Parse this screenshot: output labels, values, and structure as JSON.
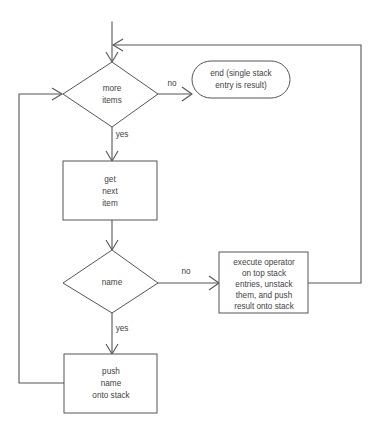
{
  "diagram": {
    "type": "flowchart",
    "background_color": "#ffffff",
    "line_color": "#555555",
    "text_color": "#3f3f3f",
    "nodes": [
      {
        "id": "start-entry",
        "shape": "entry-arrow",
        "label": ""
      },
      {
        "id": "more-items",
        "shape": "diamond",
        "lines": [
          "more",
          "items"
        ],
        "line1": "more",
        "line2": "items"
      },
      {
        "id": "end-result",
        "shape": "rounded",
        "lines": [
          "end (single stack",
          "entry is result)"
        ],
        "line1": "end (single stack",
        "line2": "entry is result)"
      },
      {
        "id": "get-next-item",
        "shape": "rect",
        "lines": [
          "get",
          "next",
          "item"
        ],
        "line1": "get",
        "line2": "next",
        "line3": "item"
      },
      {
        "id": "name-check",
        "shape": "diamond",
        "lines": [
          "name"
        ],
        "line1": "name"
      },
      {
        "id": "execute-operator",
        "shape": "rect",
        "lines": [
          "execute operator",
          "on top stack",
          "entries, unstack",
          "them, and push",
          "result onto stack"
        ],
        "line1": "execute operator",
        "line2": "on top stack",
        "line3": "entries, unstack",
        "line4": "them, and push",
        "line5": "result onto stack"
      },
      {
        "id": "push-name",
        "shape": "rect",
        "lines": [
          "push",
          "name",
          "onto stack"
        ],
        "line1": "push",
        "line2": "name",
        "line3": "onto stack"
      }
    ],
    "edge_labels": {
      "more_items_no": "no",
      "more_items_yes": "yes",
      "name_no": "no",
      "name_yes": "yes"
    },
    "edges": [
      {
        "from": "start-entry",
        "to": "more-items",
        "label": ""
      },
      {
        "from": "more-items",
        "to": "end-result",
        "label": "no"
      },
      {
        "from": "more-items",
        "to": "get-next-item",
        "label": "yes"
      },
      {
        "from": "get-next-item",
        "to": "name-check",
        "label": ""
      },
      {
        "from": "name-check",
        "to": "execute-operator",
        "label": "no"
      },
      {
        "from": "name-check",
        "to": "push-name",
        "label": "yes"
      },
      {
        "from": "execute-operator",
        "to": "more-items",
        "label": ""
      },
      {
        "from": "push-name",
        "to": "more-items",
        "label": ""
      }
    ]
  }
}
